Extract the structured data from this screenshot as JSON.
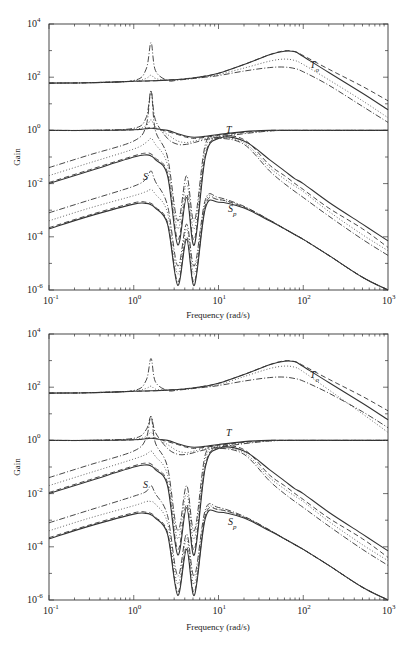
{
  "chart_data": [
    {
      "type": "line",
      "title": "",
      "xlabel": "Frequency (rad/s)",
      "ylabel": "Gain",
      "xscale": "log",
      "yscale": "log",
      "xlim": [
        0.1,
        1000
      ],
      "ylim": [
        1e-06,
        10000.0
      ],
      "grid": false,
      "legend": "none",
      "x_ticks": [
        "10^-1",
        "10^0",
        "10^1",
        "10^2",
        "10^3"
      ],
      "y_ticks": [
        "10^-6",
        "10^-4",
        "10^-2",
        "10^0",
        "10^2",
        "10^4"
      ],
      "annotations": [
        "T_o",
        "T",
        "S",
        "S_p"
      ],
      "x": [
        0.1,
        0.3,
        1.0,
        1.4,
        1.6,
        1.8,
        2.5,
        3.3,
        4.2,
        5.2,
        7,
        10,
        20,
        40,
        60,
        80,
        100,
        200,
        500,
        1000
      ],
      "series": [
        {
          "name": "T_o (solid)",
          "style": "solid",
          "values": [
            60,
            62,
            70,
            72,
            73,
            74,
            78,
            82,
            88,
            95,
            110,
            140,
            300,
            700,
            950,
            900,
            600,
            150,
            25,
            6
          ]
        },
        {
          "name": "T_o (dashed)",
          "style": "dashed",
          "values": [
            60,
            62,
            70,
            72,
            73,
            74,
            78,
            82,
            88,
            95,
            110,
            140,
            300,
            700,
            980,
            920,
            650,
            200,
            45,
            13
          ]
        },
        {
          "name": "T_o (dotted)",
          "style": "dotted",
          "values": [
            60,
            62,
            72,
            90,
            120,
            90,
            75,
            80,
            86,
            92,
            105,
            125,
            220,
            400,
            480,
            420,
            300,
            80,
            13,
            3
          ]
        },
        {
          "name": "T_o (dash-dot)",
          "style": "dashdot",
          "values": [
            60,
            62,
            75,
            200,
            2000,
            180,
            75,
            78,
            84,
            90,
            100,
            115,
            170,
            230,
            240,
            210,
            160,
            50,
            8,
            2
          ]
        },
        {
          "name": "T (solid)",
          "style": "solid",
          "values": [
            1,
            1,
            1.05,
            1.15,
            1.2,
            1.15,
            1.0,
            0.75,
            0.6,
            0.55,
            0.6,
            0.7,
            0.9,
            1.0,
            1.0,
            1.0,
            1.0,
            1.0,
            1.0,
            1.0
          ]
        },
        {
          "name": "T (dashed)",
          "style": "dashed",
          "values": [
            1,
            1,
            1.05,
            1.2,
            1.3,
            1.2,
            0.9,
            0.7,
            0.55,
            0.5,
            0.55,
            0.65,
            0.85,
            1.0,
            1.0,
            1.0,
            1.0,
            1.0,
            1.0,
            1.0
          ]
        },
        {
          "name": "T (dotted)",
          "style": "dotted",
          "values": [
            1,
            1,
            1.1,
            1.5,
            2.5,
            1.4,
            0.7,
            0.4,
            0.35,
            0.4,
            0.5,
            0.6,
            0.8,
            0.95,
            1.0,
            1.0,
            1.0,
            1.0,
            1.0,
            1.0
          ]
        },
        {
          "name": "T (dash-dot)",
          "style": "dashdot",
          "values": [
            1,
            1,
            1.2,
            3,
            30,
            2.5,
            0.5,
            0.3,
            0.3,
            0.35,
            0.45,
            0.55,
            0.75,
            0.95,
            1.0,
            1.0,
            1.0,
            1.0,
            1.0,
            1.0
          ]
        },
        {
          "name": "S (solid)",
          "style": "solid",
          "values": [
            0.01,
            0.03,
            0.1,
            0.12,
            0.11,
            0.08,
            0.02,
            5e-05,
            0.003,
            5e-05,
            0.1,
            0.5,
            0.4,
            0.08,
            0.03,
            0.015,
            0.01,
            0.002,
            0.0003,
            7e-05
          ]
        },
        {
          "name": "S (dashed)",
          "style": "dashed",
          "values": [
            0.011,
            0.033,
            0.11,
            0.14,
            0.13,
            0.09,
            0.025,
            8e-05,
            0.004,
            8e-05,
            0.12,
            0.55,
            0.45,
            0.05,
            0.02,
            0.01,
            0.006,
            0.0012,
            0.0002,
            4e-05
          ]
        },
        {
          "name": "S (dotted)",
          "style": "dotted",
          "values": [
            0.02,
            0.06,
            0.2,
            0.35,
            0.5,
            0.3,
            0.05,
            0.0002,
            0.01,
            0.0002,
            0.2,
            0.5,
            0.35,
            0.04,
            0.015,
            0.008,
            0.005,
            0.0009,
            0.00012,
            3e-05
          ]
        },
        {
          "name": "S (dash-dot)",
          "style": "dashdot",
          "values": [
            0.04,
            0.12,
            0.4,
            1.5,
            30,
            1.0,
            0.1,
            0.0004,
            0.02,
            0.0004,
            0.3,
            0.5,
            0.3,
            0.03,
            0.01,
            0.005,
            0.003,
            0.0006,
            8e-05,
            2e-05
          ]
        },
        {
          "name": "S_p (solid)",
          "style": "solid",
          "values": [
            0.0002,
            0.0006,
            0.0017,
            0.0018,
            0.0016,
            0.0012,
            0.0003,
            1.5e-06,
            8e-05,
            1.5e-06,
            0.0012,
            0.002,
            0.0012,
            0.0004,
            0.0002,
            0.00012,
            8e-05,
            2e-05,
            3e-06,
            1e-06
          ]
        },
        {
          "name": "S_p (dashed)",
          "style": "dashed",
          "values": [
            0.00022,
            0.00066,
            0.0019,
            0.002,
            0.0018,
            0.0013,
            0.00035,
            2e-06,
            0.0001,
            2e-06,
            0.0015,
            0.0025,
            0.0013,
            0.00042,
            0.0002,
            0.00012,
            8e-05,
            2e-05,
            3e-06,
            1e-06
          ]
        },
        {
          "name": "S_p (dotted)",
          "style": "dotted",
          "values": [
            0.0004,
            0.0012,
            0.0035,
            0.005,
            0.006,
            0.004,
            0.0008,
            4e-06,
            0.0002,
            4e-06,
            0.002,
            0.0025,
            0.0013,
            0.00042,
            0.0002,
            0.00012,
            8e-05,
            2e-05,
            3e-06,
            1e-06
          ]
        },
        {
          "name": "S_p (dash-dot)",
          "style": "dashdot",
          "values": [
            0.0008,
            0.0024,
            0.008,
            0.015,
            0.03,
            0.012,
            0.0015,
            8e-06,
            0.0003,
            8e-06,
            0.0025,
            0.003,
            0.0014,
            0.00043,
            0.0002,
            0.00012,
            8e-05,
            2e-05,
            3e-06,
            1e-06
          ]
        }
      ]
    },
    {
      "type": "line",
      "title": "",
      "xlabel": "Frequency (rad/s)",
      "ylabel": "Gain",
      "xscale": "log",
      "yscale": "log",
      "xlim": [
        0.1,
        1000
      ],
      "ylim": [
        1e-06,
        10000.0
      ],
      "grid": false,
      "legend": "none",
      "x_ticks": [
        "10^-1",
        "10^0",
        "10^1",
        "10^2",
        "10^3"
      ],
      "y_ticks": [
        "10^-6",
        "10^-4",
        "10^-2",
        "10^0",
        "10^2",
        "10^4"
      ],
      "annotations": [
        "T_o",
        "T",
        "S",
        "S_p"
      ],
      "x": [
        0.1,
        0.3,
        1.0,
        1.4,
        1.6,
        1.8,
        2.5,
        3.3,
        4.2,
        5.2,
        7,
        10,
        20,
        40,
        60,
        80,
        100,
        200,
        500,
        1000
      ],
      "series": [
        {
          "name": "T_o (solid)",
          "style": "solid",
          "values": [
            60,
            62,
            70,
            72,
            73,
            74,
            78,
            82,
            88,
            95,
            110,
            140,
            300,
            700,
            950,
            900,
            600,
            150,
            25,
            6
          ]
        },
        {
          "name": "T_o (dashed)",
          "style": "dashed",
          "values": [
            60,
            62,
            70,
            72,
            73,
            74,
            78,
            82,
            88,
            95,
            110,
            140,
            300,
            700,
            980,
            920,
            650,
            200,
            45,
            13
          ]
        },
        {
          "name": "T_o (dotted)",
          "style": "dotted",
          "values": [
            60,
            62,
            72,
            90,
            110,
            85,
            75,
            80,
            86,
            92,
            105,
            125,
            250,
            500,
            620,
            560,
            380,
            80,
            10,
            2
          ]
        },
        {
          "name": "T_o (dash-dot)",
          "style": "dashdot",
          "values": [
            60,
            62,
            75,
            180,
            1200,
            160,
            75,
            78,
            84,
            90,
            100,
            115,
            170,
            230,
            240,
            210,
            170,
            60,
            12,
            3
          ]
        },
        {
          "name": "T (solid)",
          "style": "solid",
          "values": [
            1,
            1,
            1.05,
            1.15,
            1.2,
            1.15,
            1.0,
            0.75,
            0.6,
            0.55,
            0.6,
            0.7,
            0.9,
            1.0,
            1.0,
            1.0,
            1.0,
            1.0,
            1.0,
            1.0
          ]
        },
        {
          "name": "T (dashed)",
          "style": "dashed",
          "values": [
            1,
            1,
            1.05,
            1.2,
            1.3,
            1.2,
            0.9,
            0.7,
            0.55,
            0.5,
            0.55,
            0.65,
            0.85,
            1.0,
            1.0,
            1.0,
            1.0,
            1.0,
            1.0,
            1.0
          ]
        },
        {
          "name": "T (dotted)",
          "style": "dotted",
          "values": [
            1,
            1,
            1.1,
            1.4,
            2.0,
            1.3,
            0.7,
            0.4,
            0.35,
            0.4,
            0.5,
            0.6,
            0.8,
            0.95,
            1.0,
            1.0,
            1.0,
            1.0,
            1.0,
            1.0
          ]
        },
        {
          "name": "T (dash-dot)",
          "style": "dashdot",
          "values": [
            1,
            1,
            1.2,
            2.5,
            8,
            2.0,
            0.5,
            0.3,
            0.3,
            0.35,
            0.45,
            0.55,
            0.75,
            0.95,
            1.0,
            1.0,
            1.0,
            1.0,
            1.0,
            1.0
          ]
        },
        {
          "name": "S (solid)",
          "style": "solid",
          "values": [
            0.01,
            0.03,
            0.1,
            0.12,
            0.11,
            0.08,
            0.02,
            5e-05,
            0.003,
            5e-05,
            0.1,
            0.5,
            0.4,
            0.08,
            0.03,
            0.015,
            0.01,
            0.002,
            0.0003,
            7e-05
          ]
        },
        {
          "name": "S (dashed)",
          "style": "dashed",
          "values": [
            0.011,
            0.033,
            0.11,
            0.14,
            0.13,
            0.09,
            0.025,
            8e-05,
            0.004,
            8e-05,
            0.12,
            0.55,
            0.45,
            0.05,
            0.02,
            0.01,
            0.006,
            0.0012,
            0.0002,
            4e-05
          ]
        },
        {
          "name": "S (dotted)",
          "style": "dotted",
          "values": [
            0.02,
            0.06,
            0.2,
            0.3,
            0.4,
            0.25,
            0.05,
            0.0002,
            0.01,
            0.0002,
            0.2,
            0.5,
            0.35,
            0.04,
            0.015,
            0.008,
            0.005,
            0.0009,
            0.00012,
            3e-05
          ]
        },
        {
          "name": "S (dash-dot)",
          "style": "dashdot",
          "values": [
            0.04,
            0.12,
            0.4,
            1.2,
            8,
            0.8,
            0.1,
            0.0004,
            0.02,
            0.0004,
            0.3,
            0.5,
            0.3,
            0.03,
            0.01,
            0.005,
            0.003,
            0.0006,
            8e-05,
            2e-05
          ]
        },
        {
          "name": "S_p (solid)",
          "style": "solid",
          "values": [
            0.0002,
            0.0006,
            0.0017,
            0.0018,
            0.0016,
            0.0012,
            0.0003,
            1.5e-06,
            8e-05,
            1.5e-06,
            0.0012,
            0.002,
            0.0012,
            0.0004,
            0.0002,
            0.00012,
            8e-05,
            2e-05,
            3e-06,
            1e-06
          ]
        },
        {
          "name": "S_p (dashed)",
          "style": "dashed",
          "values": [
            0.00022,
            0.00066,
            0.0019,
            0.002,
            0.0018,
            0.0013,
            0.00035,
            2e-06,
            0.0001,
            2e-06,
            0.0015,
            0.0025,
            0.0013,
            0.00042,
            0.0002,
            0.00012,
            8e-05,
            2e-05,
            3e-06,
            1e-06
          ]
        },
        {
          "name": "S_p (dotted)",
          "style": "dotted",
          "values": [
            0.0004,
            0.0012,
            0.0035,
            0.005,
            0.005,
            0.004,
            0.0008,
            4e-06,
            0.0002,
            4e-06,
            0.002,
            0.0025,
            0.0013,
            0.00042,
            0.0002,
            0.00012,
            8e-05,
            2e-05,
            3e-06,
            1e-06
          ]
        },
        {
          "name": "S_p (dash-dot)",
          "style": "dashdot",
          "values": [
            0.0008,
            0.0024,
            0.008,
            0.012,
            0.02,
            0.01,
            0.0015,
            8e-06,
            0.0003,
            8e-06,
            0.0025,
            0.003,
            0.0014,
            0.00043,
            0.0002,
            0.00012,
            8e-05,
            2e-05,
            3e-06,
            1e-06
          ]
        }
      ]
    }
  ],
  "panels": [
    {
      "frame": {
        "left": 49,
        "top": 24,
        "right": 388,
        "bottom": 290
      },
      "labels": {
        "T_o": {
          "main": "T",
          "sub": "o",
          "x": 310,
          "y": 68
        },
        "T": {
          "main": "T",
          "x": 226,
          "y": 133
        },
        "S": {
          "main": "S",
          "x": 143,
          "y": 180
        },
        "S_p": {
          "main": "S",
          "sub": "p",
          "x": 228,
          "y": 212
        }
      },
      "ylabel_pos": {
        "x": 20,
        "y": 157
      },
      "xlabel_pos": {
        "x": 218,
        "y": 318
      }
    },
    {
      "frame": {
        "left": 49,
        "top": 334,
        "right": 388,
        "bottom": 600
      },
      "labels": {
        "T_o": {
          "main": "T",
          "sub": "o",
          "x": 310,
          "y": 378
        },
        "T": {
          "main": "T",
          "x": 226,
          "y": 436
        },
        "S": {
          "main": "S",
          "x": 143,
          "y": 488
        },
        "S_p": {
          "main": "S",
          "sub": "p",
          "x": 228,
          "y": 525
        }
      },
      "ylabel_pos": {
        "x": 20,
        "y": 467
      },
      "xlabel_pos": {
        "x": 218,
        "y": 630
      }
    }
  ],
  "text": {
    "xlabel": "Frequency (rad/s)",
    "ylabel": "Gain",
    "x_tick_base": "10",
    "x_tick_exps": [
      "-1",
      "0",
      "1",
      "2",
      "3"
    ],
    "y_tick_base": "10",
    "y_tick_exps": [
      "4",
      "2",
      "0",
      "-2",
      "-4",
      "-6"
    ]
  }
}
